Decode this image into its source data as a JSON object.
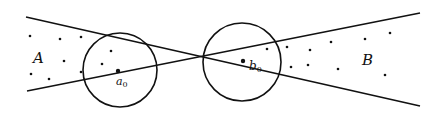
{
  "diagram": {
    "labels": {
      "region_a": "A",
      "region_b": "B",
      "point_a0": "a",
      "point_a0_sub": "0",
      "point_b0": "b",
      "point_b0_sub": "0"
    },
    "colors": {
      "stroke": "#111111",
      "background": "#ffffff"
    },
    "lines": [
      {
        "name": "line-upper-left-to-lower-right",
        "x1": 26,
        "y1": 17,
        "x2": 420,
        "y2": 106
      },
      {
        "name": "line-lower-left-to-upper-right",
        "x1": 27,
        "y1": 91,
        "x2": 420,
        "y2": 13
      }
    ],
    "circles": [
      {
        "name": "circle-a0",
        "cx": 120,
        "cy": 70,
        "r": 37
      },
      {
        "name": "circle-b0",
        "cx": 242,
        "cy": 62,
        "r": 39
      }
    ],
    "centers": [
      {
        "name": "a0",
        "x": 118,
        "y": 71
      },
      {
        "name": "b0",
        "x": 243,
        "y": 61
      }
    ],
    "dots_a": [
      [
        30,
        36
      ],
      [
        60,
        39
      ],
      [
        81,
        37
      ],
      [
        111,
        51
      ],
      [
        64,
        61
      ],
      [
        102,
        64
      ],
      [
        31,
        74
      ],
      [
        49,
        79
      ],
      [
        81,
        72
      ]
    ],
    "dots_b": [
      [
        267,
        49
      ],
      [
        287,
        47
      ],
      [
        310,
        50
      ],
      [
        331,
        42
      ],
      [
        365,
        39
      ],
      [
        390,
        33
      ],
      [
        291,
        67
      ],
      [
        308,
        65
      ],
      [
        338,
        69
      ],
      [
        385,
        75
      ]
    ]
  }
}
